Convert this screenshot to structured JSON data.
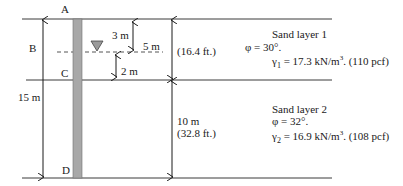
{
  "points": {
    "A": "A",
    "B": "B",
    "C": "C",
    "D": "D"
  },
  "dimensions": {
    "total_depth": "15 m",
    "water_depth_above": "3 m",
    "water_depth_ft_layer1": "5 m",
    "below_water": "2 m",
    "layer1_ft": "(16.4 ft.)",
    "layer2_m": "10 m",
    "layer2_ft": "(32.8 ft.)"
  },
  "layer1": {
    "title": "Sand layer 1",
    "phi": "φ = 30°.",
    "gamma_symbol": "γ",
    "gamma_sub": "1",
    "gamma_value": " = 17.3 kN/m",
    "gamma_sup": "3",
    "gamma_tail": ". (110 pcf)"
  },
  "layer2": {
    "title": "Sand layer 2",
    "phi": "φ = 32°.",
    "gamma_symbol": "γ",
    "gamma_sub": "2",
    "gamma_value": " = 16.9 kN/m",
    "gamma_sup": "3",
    "gamma_tail": ".  (108 pcf)"
  },
  "colors": {
    "line": "#3a3a3a",
    "pile": "#a8a8a8",
    "pile_edge": "#6e6e6e",
    "water": "#9a9a9a"
  }
}
